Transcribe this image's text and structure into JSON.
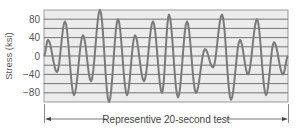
{
  "chart_data": {
    "type": "line",
    "title": "",
    "xlabel": "",
    "ylabel": "Stress (ksi)",
    "ylim": [
      -100,
      100
    ],
    "yticks": [
      80,
      40,
      0,
      -40,
      -80
    ],
    "ytick_labels": [
      "80",
      "40",
      "0",
      "−40",
      "−80"
    ],
    "grid": true,
    "grid_step": 20,
    "annotation": "Representive 20-second test",
    "series": [
      {
        "name": "stress",
        "x_px": [
          44,
          48,
          57,
          65,
          74,
          83,
          91,
          100,
          109,
          118,
          127,
          135,
          144,
          153,
          162,
          169,
          178,
          187,
          196,
          205,
          213,
          222,
          231,
          240,
          248,
          257,
          266,
          274,
          283,
          288
        ],
        "values": [
          0,
          35,
          -35,
          75,
          -85,
          45,
          -55,
          100,
          -100,
          80,
          -85,
          45,
          -55,
          75,
          -80,
          90,
          -90,
          75,
          -80,
          15,
          -25,
          90,
          -95,
          35,
          -40,
          80,
          -85,
          30,
          -40,
          0
        ]
      }
    ],
    "colors": {
      "plot_bg": "#ececec",
      "grid": "#555555",
      "line": "#7a7a7a",
      "frame": "#999999",
      "text": "#555555"
    }
  }
}
